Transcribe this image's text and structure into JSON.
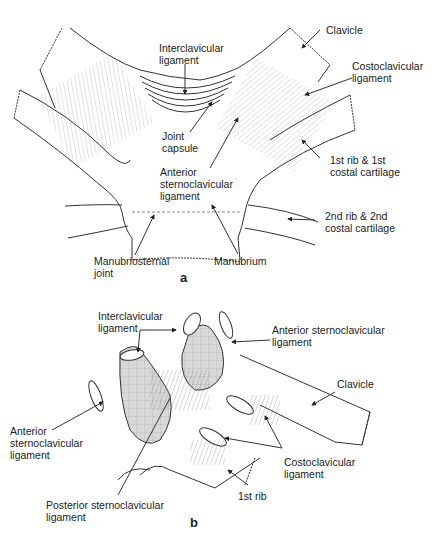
{
  "figure": {
    "panel_a": {
      "letter": "a",
      "labels": {
        "clavicle": "Clavicle",
        "interclavicular_1": "Interclavicular",
        "interclavicular_2": "ligament",
        "costoclavicular_1": "Costoclavicular",
        "costoclavicular_2": "ligament",
        "joint_capsule_1": "Joint",
        "joint_capsule_2": "capsule",
        "anterior_sc_1": "Anterior",
        "anterior_sc_2": "sternoclavicular",
        "anterior_sc_3": "ligament",
        "first_rib_1": "1st rib & 1st",
        "first_rib_2": "costal cartilage",
        "second_rib_1": "2nd rib & 2nd",
        "second_rib_2": "costal cartilage",
        "manubriosternal_1": "Manubriosternal",
        "manubriosternal_2": "joint",
        "manubrium": "Manubrium"
      }
    },
    "panel_b": {
      "letter": "b",
      "labels": {
        "interclavicular_1": "Interclavicular",
        "interclavicular_2": "ligament",
        "anterior_sc_right_1": "Anterior sternoclavicular",
        "anterior_sc_right_2": "ligament",
        "clavicle": "Clavicle",
        "anterior_sc_left_1": "Anterior",
        "anterior_sc_left_2": "sternoclavicular",
        "anterior_sc_left_3": "ligament",
        "costoclavicular_1": "Costoclavicular",
        "costoclavicular_2": "ligament",
        "first_rib": "1st rib",
        "posterior_sc_1": "Posterior sternoclavicular",
        "posterior_sc_2": "ligament"
      }
    }
  }
}
